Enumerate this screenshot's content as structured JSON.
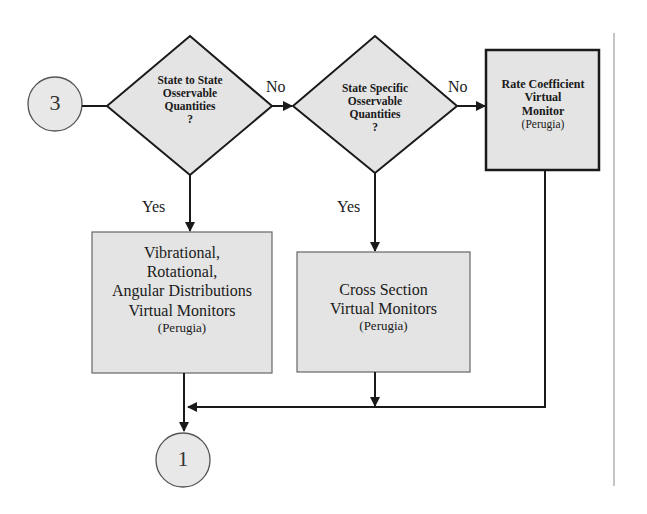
{
  "colors": {
    "fill": "#e4e4e4",
    "stroke": "#1a1a1a",
    "background": "#ffffff",
    "divider": "#888888"
  },
  "connectors": {
    "start": "3",
    "end": "1"
  },
  "decisions": [
    {
      "id": "state-to-state",
      "lines": [
        "State to State",
        "Osservable",
        "Quantities",
        "?"
      ],
      "yes_label": "Yes",
      "no_label": "No"
    },
    {
      "id": "state-specific",
      "lines": [
        "State Specific",
        "Osservable",
        "Quantities",
        "?"
      ],
      "yes_label": "Yes",
      "no_label": "No"
    }
  ],
  "processes": [
    {
      "id": "rate-coefficient",
      "lines": [
        "Rate Coefficient",
        "Virtual",
        "Monitor"
      ],
      "sub": "(Perugia)"
    },
    {
      "id": "vibrational",
      "lines": [
        "Vibrational,",
        "Rotational,",
        "Angular Distributions",
        "Virtual Monitors"
      ],
      "sub": "(Perugia)"
    },
    {
      "id": "cross-section",
      "lines": [
        "Cross Section",
        "Virtual Monitors"
      ],
      "sub": "(Perugia)"
    }
  ]
}
